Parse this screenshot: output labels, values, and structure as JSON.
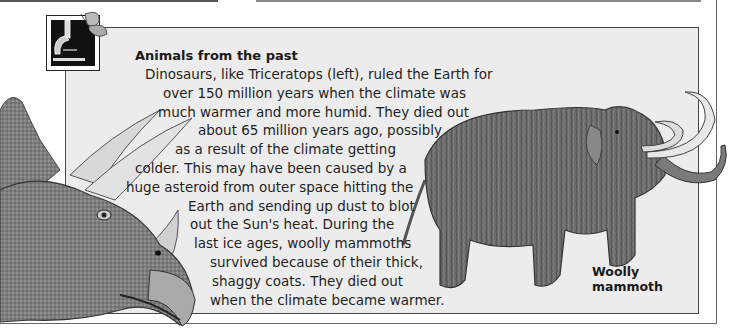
{
  "panel": {
    "title": "Animals from the past",
    "body_lines": [
      "Dinosaurs, like Triceratops (left), ruled the Earth for",
      "over 150 million years when the climate was",
      "much warmer and more humid. They died out",
      "about 65 million years ago, possibly",
      "as a result of the climate getting",
      "colder. This may have been caused by a",
      "huge asteroid from outer space hitting the",
      "Earth and sending up dust to blot",
      "out the Sun's heat. During the",
      "last ice ages, woolly mammoths",
      "survived because of their thick,",
      "shaggy coats. They died out",
      "when the climate became warmer."
    ],
    "caption_lines": [
      "Woolly",
      "mammoth"
    ]
  },
  "illustrations": {
    "left": "triceratops",
    "right": "woolly-mammoth",
    "badge": "microscope-and-butterfly"
  },
  "colors": {
    "panel_bg": "#ececec",
    "border": "#444444"
  }
}
